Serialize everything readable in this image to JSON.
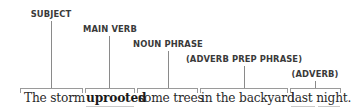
{
  "diagram": {
    "type": "sentence-structure",
    "sentence": "The storm uprooted some trees in the backyard last night.",
    "segments": [
      {
        "text": "The storm",
        "role": "SUBJECT",
        "bold": false
      },
      {
        "text": "uprooted",
        "role": "MAIN VERB",
        "bold": true
      },
      {
        "text": "some trees",
        "role": "NOUN PHRASE",
        "bold": false
      },
      {
        "text": "in the backyard",
        "role": "(ADVERB PREP PHRASE)",
        "bold": false
      },
      {
        "text": "last night.",
        "role": "(ADVERB)",
        "bold": false
      }
    ],
    "colors": {
      "label": "#3a3a3a",
      "line": "#8a8a8a",
      "text": "#2a2a2a"
    }
  }
}
